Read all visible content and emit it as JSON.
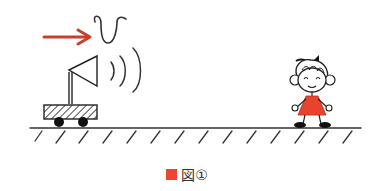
{
  "figure": {
    "velocity_symbol": "v",
    "colors": {
      "arrow": "#c8402c",
      "ink": "#222222",
      "dress": "#e8432e",
      "marker": "#ee4433"
    }
  },
  "caption": {
    "marker_icon": "red-square",
    "label": "図①"
  }
}
